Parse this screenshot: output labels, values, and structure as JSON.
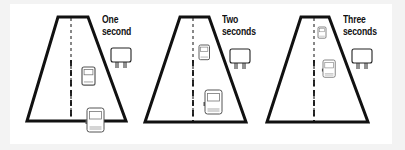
{
  "diagram": {
    "panels": [
      {
        "label_line1": "One",
        "label_line2": "second",
        "vehicles": 2
      },
      {
        "label_line1": "Two",
        "label_line2": "seconds",
        "vehicles": 2
      },
      {
        "label_line1": "Three",
        "label_line2": "seconds",
        "vehicles": 2
      }
    ],
    "colors": {
      "background": "#f3f3f3",
      "panel": "#ffffff",
      "ink": "#111111",
      "vehicle_fill": "#ffffff",
      "vehicle_stroke": "#555555"
    }
  }
}
